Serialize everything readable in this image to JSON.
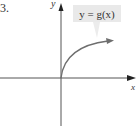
{
  "figure": {
    "problem_number": "3.",
    "axes": {
      "x_label": "x",
      "y_label": "y"
    },
    "curve": {
      "label": "y = g(x)",
      "description": "increasing concave-down curve starting at origin, arrow pointing right",
      "color": "#6e6e6e"
    },
    "colors": {
      "axis": "#555555",
      "label_box": "#e9e9e9",
      "text": "#333333"
    }
  }
}
